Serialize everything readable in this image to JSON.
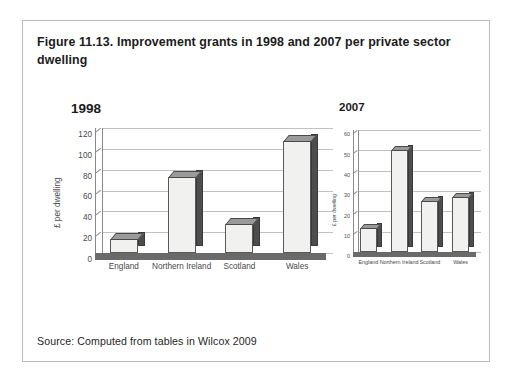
{
  "figure": {
    "title": "Figure 11.13. Improvement grants in 1998 and 2007 per private sector dwelling",
    "source": "Source: Computed from tables in Wilcox 2009"
  },
  "chart_data": [
    {
      "type": "bar",
      "title": "1998",
      "xlabel": "",
      "ylabel": "£ per dwelling",
      "categories": [
        "England",
        "Northern Ireland",
        "Scotland",
        "Wales"
      ],
      "values": [
        13,
        73,
        28,
        108
      ],
      "ylim": [
        0,
        120
      ],
      "yticks": [
        0,
        20,
        40,
        60,
        80,
        100,
        120
      ],
      "ytick_labels": [
        "0",
        "20",
        "40",
        "60",
        "80",
        "100",
        "120"
      ],
      "grid": true,
      "legend": "none",
      "style": "3d-column"
    },
    {
      "type": "bar",
      "title": "2007",
      "xlabel": "",
      "ylabel": "£ per dwelling",
      "categories": [
        "England",
        "Northern Ireland",
        "Scotland",
        "Wales"
      ],
      "values": [
        12,
        50,
        25,
        27
      ],
      "ylim": [
        0,
        60
      ],
      "yticks": [
        0,
        10,
        20,
        30,
        40,
        50,
        60
      ],
      "ytick_labels": [
        "0",
        "10",
        "20",
        "30",
        "40",
        "50",
        "60"
      ],
      "grid": true,
      "legend": "none",
      "style": "3d-column"
    }
  ]
}
